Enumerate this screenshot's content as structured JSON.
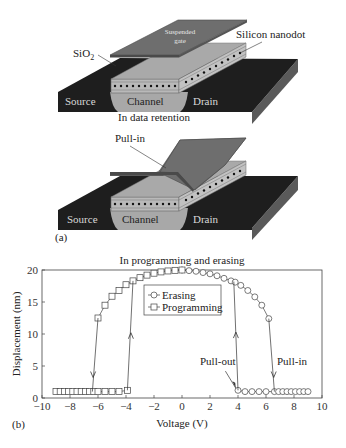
{
  "panel_a": {
    "panel_label": "(a)",
    "top_diagram": {
      "gate_label": "Suspended gate",
      "gate_label_line1": "Suspended",
      "gate_label_line2": "gate",
      "sio2_label": "SiO",
      "sio2_subscript": "2",
      "nanodot_label": "Silicon nanodot",
      "source_label": "Source",
      "channel_label": "Channel",
      "drain_label": "Drain",
      "caption": "In data retention"
    },
    "bottom_diagram": {
      "pullin_label": "Pull-in",
      "source_label": "Source",
      "channel_label": "Channel",
      "drain_label": "Drain"
    },
    "colors": {
      "substrate_dark": "#1e1e1e",
      "substrate_side": "#5a5a5a",
      "channel": "#a8a8a8",
      "oxide_layer": "#b9b9b9",
      "gate_top": "#6e6e6e",
      "gate_edge": "#4a4a4a",
      "nanodot": "#111111"
    }
  },
  "panel_b": {
    "panel_label": "(b)"
  },
  "chart_data": {
    "type": "line",
    "title": "In programming and erasing",
    "xlabel": "Voltage (V)",
    "ylabel": "Displacement (nm)",
    "xlim": [
      -10,
      10
    ],
    "ylim": [
      0,
      20
    ],
    "xticks": [
      -10,
      -8,
      -6,
      -4,
      -2,
      0,
      2,
      4,
      6,
      8,
      10
    ],
    "yticks": [
      0,
      5,
      10,
      15,
      20
    ],
    "grid": false,
    "legend_position": "upper center (inside)",
    "legend": [
      {
        "name": "Erasing",
        "marker": "circle"
      },
      {
        "name": "Programming",
        "marker": "square"
      }
    ],
    "series": [
      {
        "name": "Erasing",
        "marker": "circle",
        "x": [
          0,
          0.5,
          1,
          1.5,
          2,
          2.5,
          3,
          3.5,
          4,
          4.5,
          5,
          5.5,
          6,
          6.2,
          6.6,
          7,
          7.5,
          8,
          8.5,
          9,
          4,
          4.5,
          5,
          5.5,
          6,
          3.8
        ],
        "y": [
          20,
          19.9,
          19.8,
          19.6,
          19.4,
          19.1,
          18.7,
          18.2,
          17.6,
          16.8,
          15.8,
          14.5,
          12.5,
          12.4,
          1,
          1,
          1,
          1,
          1,
          1,
          1.2,
          1,
          1,
          1,
          1,
          18.2
        ],
        "branches": {
          "up_state": {
            "x": [
              0,
              0.5,
              1,
              1.5,
              2,
              2.5,
              3,
              3.5,
              3.8,
              4.2,
              4.7,
              5.2,
              5.7,
              6.2
            ],
            "y": [
              20,
              19.9,
              19.8,
              19.6,
              19.4,
              19.1,
              18.7,
              18.3,
              18.1,
              17.6,
              16.8,
              15.8,
              14.5,
              12.4
            ]
          },
          "down_state": {
            "x": [
              4.0,
              4.5,
              5.0,
              5.5,
              6.0,
              6.6,
              6.9,
              7.2,
              7.5,
              7.8,
              8.1,
              8.4,
              8.7,
              9.0
            ],
            "y": [
              1.2,
              1,
              1,
              1,
              1,
              1,
              1,
              1,
              1,
              1,
              1,
              1,
              1,
              1
            ]
          }
        }
      },
      {
        "name": "Programming",
        "marker": "square",
        "branches": {
          "up_state": {
            "x": [
              -6.0,
              -5.5,
              -5.0,
              -4.5,
              -4.0,
              -3.5,
              -3.0,
              -2.5,
              -2.0,
              -1.5,
              -1.0,
              -0.5,
              0
            ],
            "y": [
              12.5,
              14.5,
              15.9,
              16.8,
              17.7,
              18.3,
              18.8,
              19.2,
              19.5,
              19.7,
              19.85,
              19.95,
              20
            ]
          },
          "down_state": {
            "x": [
              -9.0,
              -8.7,
              -8.4,
              -8.1,
              -7.8,
              -7.5,
              -7.2,
              -6.9,
              -6.6,
              -6.3,
              -6.0,
              -5.5,
              -5.0,
              -4.5,
              -3.9
            ],
            "y": [
              1,
              1,
              1,
              1,
              1,
              1,
              1,
              1,
              1,
              1,
              1,
              1,
              1,
              1,
              1.2
            ]
          }
        }
      }
    ],
    "transitions": [
      {
        "from": [
          -6.0,
          12.5
        ],
        "to": [
          -6.4,
          1.0
        ],
        "direction": "down",
        "note": "programming pull-in"
      },
      {
        "from": [
          -3.9,
          1.2
        ],
        "to": [
          -3.5,
          18.3
        ],
        "direction": "up",
        "note": "programming release"
      },
      {
        "from": [
          3.7,
          18.2
        ],
        "to": [
          4.0,
          1.2
        ],
        "direction": "down-line / up-arrow",
        "note": "pull-out transition at ~4 V"
      },
      {
        "from": [
          6.2,
          12.4
        ],
        "to": [
          6.6,
          1.0
        ],
        "direction": "down",
        "note": "erasing pull-in"
      }
    ],
    "annotations": [
      {
        "text": "Pull-out",
        "x": 3.0,
        "y": 5.5,
        "arrow_to": [
          3.9,
          1.3
        ]
      },
      {
        "text": "Pull-in",
        "x": 7.5,
        "y": 5.5
      }
    ]
  }
}
